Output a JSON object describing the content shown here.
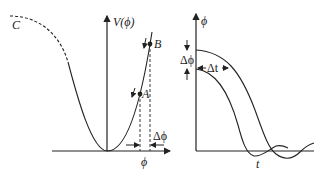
{
  "left_panel": {
    "y_axis_label": "V(ϕ)",
    "x_axis_label": "ϕ",
    "curve_label": "C",
    "point_a_label": "A",
    "point_b_label": "B",
    "delta_label": "Δϕ"
  },
  "right_panel": {
    "y_axis_label": "ϕ",
    "x_axis_label": "t",
    "delta_phi_label": "Δϕ",
    "delta_t_label": "Δt"
  },
  "colors": {
    "ink": "#222222",
    "background": "#ffffff"
  }
}
